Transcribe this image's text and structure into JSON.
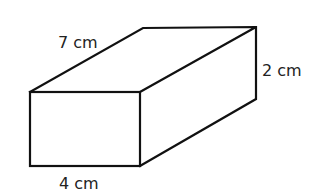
{
  "diagram": {
    "shape": "cuboid",
    "labels": {
      "length": "7 cm",
      "height": "2 cm",
      "width": "4 cm"
    },
    "colors": {
      "stroke": "#111111",
      "text": "#222222",
      "background": "#ffffff"
    }
  }
}
